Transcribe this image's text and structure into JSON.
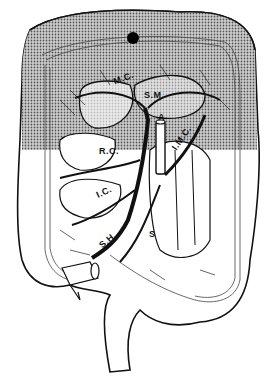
{
  "figure": {
    "type": "anatomical line drawing",
    "shaded_region_note": "upper (transverse colon) region shaded with halftone",
    "colors": {
      "line": "#111111",
      "background": "#ffffff",
      "shade": "#9a9a9a"
    }
  },
  "labels": {
    "mc": "M.C.",
    "sm": "S.M.",
    "a": "A",
    "rc": "R.C.",
    "imc": "I.M.C.",
    "ic": "I.C.",
    "sh": "S.H.",
    "s": "S"
  },
  "marker": {
    "name": "black-dot",
    "x": 133,
    "y": 38
  }
}
